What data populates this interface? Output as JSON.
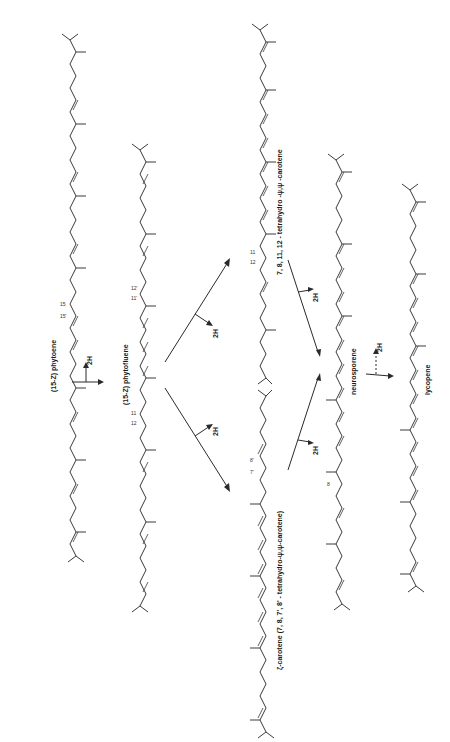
{
  "diagram": {
    "type": "biosynthetic-pathway",
    "orientation": "rotated-90-ccw",
    "compounds": [
      {
        "id": "phytoene",
        "label": "(15-Z) phytoene",
        "position_markers": [
          "15",
          "15'"
        ]
      },
      {
        "id": "phytofluene",
        "label": "(15-Z) phytofluene",
        "position_markers": [
          "11",
          "12",
          "11'",
          "12'"
        ]
      },
      {
        "id": "zeta_carotene",
        "label": "ζ-carotene (7, 8, 7', 8' - tetrahydro-ψ,ψ-carotene)",
        "position_markers": [
          "8'",
          "7'"
        ]
      },
      {
        "id": "tetrahydro_7_8_11_12",
        "label": "7, 8, 11, 12 - tetrahydro -ψ,ψ -carotene",
        "position_markers": [
          "11",
          "12"
        ]
      },
      {
        "id": "neurosporene",
        "label": "neurosporene",
        "position_markers": [
          "8"
        ]
      },
      {
        "id": "lycopene",
        "label": "lycopene",
        "position_markers": []
      }
    ],
    "reactions": [
      {
        "from": "phytoene",
        "to": "phytofluene",
        "byproduct": "2H"
      },
      {
        "from": "phytofluene",
        "to": "zeta_carotene",
        "byproduct": "2H"
      },
      {
        "from": "phytofluene",
        "to": "tetrahydro_7_8_11_12",
        "byproduct": "2H"
      },
      {
        "from": "zeta_carotene",
        "to": "neurosporene",
        "byproduct": "2H"
      },
      {
        "from": "tetrahydro_7_8_11_12",
        "to": "neurosporene",
        "byproduct": "2H"
      },
      {
        "from": "neurosporene",
        "to": "lycopene",
        "byproduct": "2H"
      }
    ],
    "byproduct_label": "2H",
    "colors": {
      "ink": "#2a2a2a",
      "background": "#ffffff"
    }
  }
}
